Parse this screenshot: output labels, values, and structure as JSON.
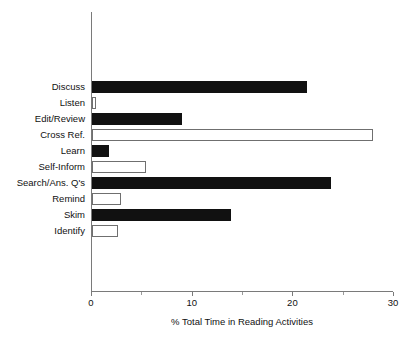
{
  "chart_data": {
    "type": "bar",
    "orientation": "horizontal",
    "title": "",
    "subtitle": "",
    "xlabel": "% Total Time in Reading Activities",
    "ylabel": "",
    "xlim": [
      0,
      30
    ],
    "ylim": null,
    "grid": false,
    "legend": null,
    "legend_position": "none",
    "xticks": [
      0,
      10,
      20,
      30
    ],
    "xtick_labels": [
      "0",
      "10",
      "20",
      "30"
    ],
    "xminor_ticks": [
      5,
      15,
      25
    ],
    "categories": [
      "Discuss",
      "Listen",
      "Edit/Review",
      "Cross Ref.",
      "Learn",
      "Self-Inform",
      "Search/Ans. Q's",
      "Remind",
      "Skim",
      "Identify"
    ],
    "values": [
      21.4,
      0.4,
      8.9,
      27.9,
      1.7,
      5.4,
      23.7,
      2.9,
      13.8,
      2.6
    ],
    "bar_styles": [
      "filled",
      "hollow",
      "filled",
      "hollow",
      "filled",
      "hollow",
      "filled",
      "hollow",
      "filled",
      "hollow"
    ],
    "colors": {
      "filled_bar": "#111111",
      "hollow_bar_fill": "#ffffff",
      "hollow_bar_edge": "#6f6f6f",
      "axis": "#7a7a7a",
      "text": "#111111",
      "background": "#ffffff"
    }
  }
}
